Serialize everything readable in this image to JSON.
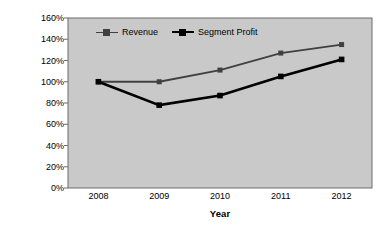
{
  "chart_data": {
    "type": "line",
    "title": "",
    "xlabel": "Year",
    "ylabel": "Trend Percentage",
    "categories": [
      "2008",
      "2009",
      "2010",
      "2011",
      "2012"
    ],
    "x": [
      2008,
      2009,
      2010,
      2011,
      2012
    ],
    "series": [
      {
        "name": "Revenue",
        "values": [
          100,
          100,
          111,
          127,
          135
        ],
        "color": "#404040",
        "marker": "square"
      },
      {
        "name": "Segment Profit",
        "values": [
          100,
          78,
          87,
          105,
          121
        ],
        "color": "#000000",
        "marker": "square"
      }
    ],
    "ylim": [
      0,
      160
    ],
    "ytick_values": [
      0,
      20,
      40,
      60,
      80,
      100,
      120,
      140,
      160
    ],
    "ytick_labels": [
      "0%",
      "20%",
      "40%",
      "60%",
      "80%",
      "100%",
      "120%",
      "140%",
      "160%"
    ],
    "grid": false,
    "legend_position": "top-center",
    "plot_background": "#c9c9c9",
    "page_background": "#ffffff",
    "axis_color": "#6d6d6d"
  }
}
